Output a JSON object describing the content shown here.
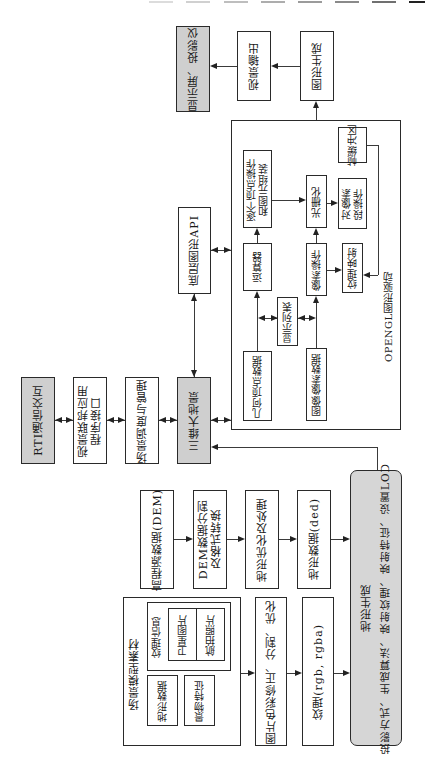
{
  "diagram": {
    "orientation": "rotated 90 degrees counter-clockwise",
    "top_decoration_dash_colors": [
      "#d8d8d8",
      "#cfcfcf",
      "#bdbdbd",
      "#ababab",
      "#9a9a9a",
      "#888888",
      "#6f6f6f",
      "#222222"
    ],
    "output_chain": {
      "display": "显示屏、投影仪",
      "visual_output": "视景输出",
      "graphics_generation": "图形生成"
    },
    "opengl": {
      "label": "OPENGL图形驱动",
      "frame_buffer": "帧缓冲区",
      "vertex_ops_line1": "逐个顶点操作",
      "vertex_ops_line2": "和图元组装",
      "rasterization": "光栅化",
      "fragment_ops_line1": "对像素",
      "fragment_ops_line2": "段操作",
      "evaluator": "运算器",
      "pixel_ops": "像素操作",
      "texture_mapping": "纹理映射",
      "display_list": "显示列表",
      "geometry_vertex_data": "几何顶点数据",
      "image_pixel_data": "图像像素数据"
    },
    "graphics_api": "底层图形API",
    "main_chain": {
      "rti": "RTI通信交互",
      "federation_api_line1": "视景联邦应用",
      "federation_api_line2": "程序接口",
      "scene_scheduling": "场景调度与管理",
      "terrain_3d": "三维大地景"
    },
    "dem_chain": {
      "dem_source": "高程源数据(DEM)",
      "dem_split_line1": "DEM数据分割",
      "dem_split_line2": "及格式转换",
      "terrain_optimize": "地形优化及处理",
      "terrain_data": "地形数据(ded)"
    },
    "scene_materials": {
      "title": "场景模型素材",
      "texture_info": "纹理信息",
      "satellite": "卫星图片",
      "aerial": "航拍照片",
      "terrain_data": "地形数据",
      "feature": "景物特征"
    },
    "image_chain": {
      "color_correction": "图片色彩修正、分割、优化",
      "texture": "纹理(rgb, rgba)"
    },
    "terrain_generation": {
      "title": "地形生成",
      "detail": "投影方式、生成算法、映射纹理、映射特征、设置LOD"
    }
  }
}
